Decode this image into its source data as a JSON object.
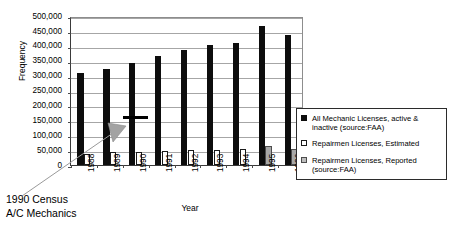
{
  "chart_data": {
    "type": "bar",
    "title": "",
    "xlabel": "Year",
    "ylabel": "Frequency",
    "ylim": [
      0,
      500000
    ],
    "ytick_step": 50000,
    "grid": true,
    "legend_position": "right",
    "categories": [
      "1988",
      "1989",
      "1990",
      "1991",
      "1992",
      "1993",
      "1994",
      "1995",
      "1996"
    ],
    "yticks": [
      "0",
      "50,000",
      "100,000",
      "150,000",
      "200,000",
      "250,000",
      "300,000",
      "350,000",
      "400,000",
      "450,000",
      "500,000"
    ],
    "series": [
      {
        "name": "All Mechanic Licenses, active & inactive (source:FAA)",
        "color": "#0d0d0d",
        "values": [
          310000,
          323000,
          342000,
          366000,
          385000,
          402000,
          411000,
          468000,
          435000
        ]
      },
      {
        "name": "Repairmen Licenses, Estimated",
        "color": "#ffffff",
        "values": [
          38000,
          42000,
          45000,
          46000,
          50000,
          51000,
          53000,
          0,
          0
        ]
      },
      {
        "name": "Repairmen Licenses, Reported (source:FAA)",
        "color": "#a8a8a8",
        "values": [
          0,
          0,
          0,
          0,
          0,
          0,
          0,
          64000,
          55000
        ]
      }
    ],
    "annotations": [
      {
        "name": "1990-census-marker",
        "text": "1990 Census\nA/C Mechanics",
        "value": 163000,
        "category": "1990"
      }
    ]
  },
  "legend": {
    "entries": [
      {
        "label": "All Mechanic Licenses, active & inactive (source:FAA)",
        "swatch": "black-square-icon"
      },
      {
        "label": "Repairmen Licenses, Estimated",
        "swatch": "white-square-icon"
      },
      {
        "label": "Repairmen Licenses, Reported (source:FAA)",
        "swatch": "gray-square-icon"
      }
    ]
  },
  "axes": {
    "y_title": "Frequency",
    "x_title": "Year"
  },
  "annotation": {
    "label": "1990 Census\nA/C Mechanics"
  }
}
